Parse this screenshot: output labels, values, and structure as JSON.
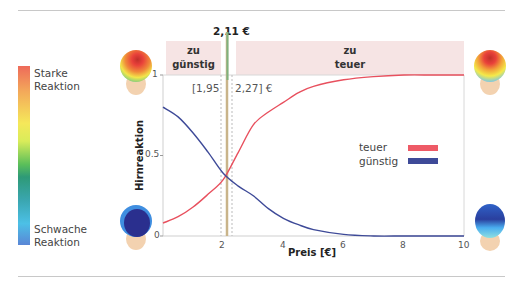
{
  "legend_colorbar": {
    "top_label": "Starke\nReaktion",
    "bottom_label": "Schwache\nReaktion"
  },
  "bands": {
    "left": "zu\ngünstig",
    "right": "zu\nteuer"
  },
  "price_marker": "2,11 €",
  "interval": {
    "left": "[1,95",
    "right": "2,27] €"
  },
  "legend": {
    "teuer": "teuer",
    "guenstig": "günstig"
  },
  "colors": {
    "teuer": "#e8505e",
    "guenstig": "#3e4a98",
    "marker": "#7fb27f",
    "band": "#f6e4e4"
  },
  "chart_data": {
    "type": "line",
    "title": "",
    "xlabel": "Preis [€]",
    "ylabel": "Hirnreaktion",
    "xlim": [
      0,
      10
    ],
    "ylim": [
      0,
      1
    ],
    "xticks": [
      2,
      4,
      6,
      8,
      10
    ],
    "yticks": [
      0,
      0.5,
      1
    ],
    "ytick_labels": [
      "0",
      "0.5",
      "1"
    ],
    "x": [
      0,
      0.5,
      1,
      1.5,
      2,
      2.5,
      3,
      3.5,
      4,
      4.5,
      5,
      6,
      7,
      8,
      9,
      10
    ],
    "series": [
      {
        "name": "teuer",
        "color": "#e8505e",
        "values": [
          0.08,
          0.12,
          0.18,
          0.26,
          0.35,
          0.52,
          0.69,
          0.77,
          0.83,
          0.89,
          0.93,
          0.97,
          0.99,
          1.0,
          1.0,
          1.0
        ]
      },
      {
        "name": "günstig",
        "color": "#3e4a98",
        "values": [
          0.8,
          0.74,
          0.64,
          0.52,
          0.39,
          0.31,
          0.25,
          0.17,
          0.11,
          0.07,
          0.04,
          0.01,
          0.0,
          0.0,
          0.0,
          0.0
        ]
      }
    ],
    "annotations": [
      {
        "type": "vline",
        "x": 2.11,
        "label": "2,11 €",
        "style": "solid"
      },
      {
        "type": "vline",
        "x": 1.95,
        "style": "dotted"
      },
      {
        "type": "vline",
        "x": 2.27,
        "style": "dotted"
      },
      {
        "type": "text",
        "text": "[1,95 2,27] €"
      },
      {
        "type": "band",
        "label": "zu günstig",
        "x_range": [
          0,
          1.95
        ]
      },
      {
        "type": "band",
        "label": "zu teuer",
        "x_range": [
          2.27,
          10
        ]
      }
    ],
    "legend_position": "right-middle"
  }
}
